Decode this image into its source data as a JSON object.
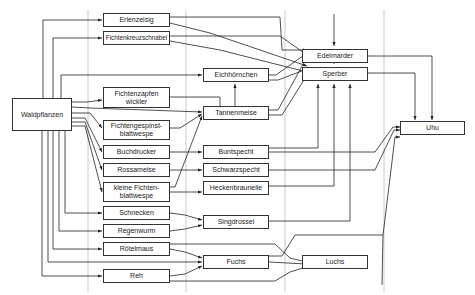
{
  "diagram": {
    "nodes": {
      "waldpflanzen": "Waldpflanzen",
      "erlenzeisig": "Erlenzeisig",
      "fichtenkreuzschnabel": "Fichtenkreuzschnabel",
      "fichtenzapfenwickler": "Fichtenzapfen wickler",
      "fichtengespinstblattwespe": "Fichtengespinst- blattwespe",
      "buchdrucker": "Buchdrucker",
      "rossameise": "Rossameise",
      "kleine_fichtenblattwespe": "kleine Fichten- blattwespe",
      "schnecken": "Schnecken",
      "regenwurm": "Regenwurm",
      "roetelmaus": "Rötelmaus",
      "reh": "Reh",
      "eichhoernchen": "Eichhörnchen",
      "tannenmeise": "Tannenmeise",
      "buntspecht": "Buntspecht",
      "schwarzspecht": "Schwarzspecht",
      "heckenbraunelle": "Heckenbraunelle",
      "singdrossel": "Singdrossel",
      "fuchs": "Fuchs",
      "edelmarder": "Edelmarder",
      "sperber": "Sperber",
      "luchs": "Luchs",
      "uhu": "Uhu"
    },
    "edges": [
      [
        "Waldpflanzen",
        "Erlenzeisig"
      ],
      [
        "Waldpflanzen",
        "Fichtenkreuzschnabel"
      ],
      [
        "Waldpflanzen",
        "Eichhörnchen"
      ],
      [
        "Waldpflanzen",
        "Fichtenzapfen wickler"
      ],
      [
        "Waldpflanzen",
        "Tannenmeise"
      ],
      [
        "Waldpflanzen",
        "Fichtengespinst- blattwespe"
      ],
      [
        "Waldpflanzen",
        "Buchdrucker"
      ],
      [
        "Waldpflanzen",
        "Rossameise"
      ],
      [
        "Waldpflanzen",
        "kleine Fichten- blattwespe"
      ],
      [
        "Waldpflanzen",
        "Schnecken"
      ],
      [
        "Waldpflanzen",
        "Regenwurm"
      ],
      [
        "Waldpflanzen",
        "Rötelmaus"
      ],
      [
        "Waldpflanzen",
        "Fuchs"
      ],
      [
        "Waldpflanzen",
        "Reh"
      ],
      [
        "Erlenzeisig",
        "Edelmarder"
      ],
      [
        "Erlenzeisig",
        "Sperber"
      ],
      [
        "Fichtenkreuzschnabel",
        "Edelmarder"
      ],
      [
        "Fichtenkreuzschnabel",
        "Sperber"
      ],
      [
        "Fichtenzapfen wickler",
        "Tannenmeise"
      ],
      [
        "Fichtengespinst- blattwespe",
        "Tannenmeise"
      ],
      [
        "kleine Fichten- blattwespe",
        "Tannenmeise"
      ],
      [
        "Buchdrucker",
        "Buntspecht"
      ],
      [
        "Rossameise",
        "Schwarzspecht"
      ],
      [
        "kleine Fichten- blattwespe",
        "Heckenbraunelle"
      ],
      [
        "Schnecken",
        "Singdrossel"
      ],
      [
        "Regenwurm",
        "Singdrossel"
      ],
      [
        "Rötelmaus",
        "Fuchs"
      ],
      [
        "Rötelmaus",
        "Luchs"
      ],
      [
        "Reh",
        "Fuchs"
      ],
      [
        "Reh",
        "Luchs"
      ],
      [
        "Eichhörnchen",
        "Edelmarder"
      ],
      [
        "Eichhörnchen",
        "Sperber"
      ],
      [
        "Tannenmeise",
        "Eichhörnchen"
      ],
      [
        "Tannenmeise",
        "Edelmarder"
      ],
      [
        "Tannenmeise",
        "Sperber"
      ],
      [
        "Sperber",
        "Edelmarder"
      ],
      [
        "Buntspecht",
        "Sperber"
      ],
      [
        "Heckenbraunelle",
        "Sperber"
      ],
      [
        "Singdrossel",
        "Sperber"
      ],
      [
        "Buntspecht",
        "Uhu"
      ],
      [
        "Schwarzspecht",
        "Uhu"
      ],
      [
        "Fuchs",
        "Uhu"
      ],
      [
        "Fuchs",
        "Luchs"
      ],
      [
        "Edelmarder",
        "Uhu"
      ],
      [
        "Sperber",
        "Uhu"
      ]
    ]
  }
}
